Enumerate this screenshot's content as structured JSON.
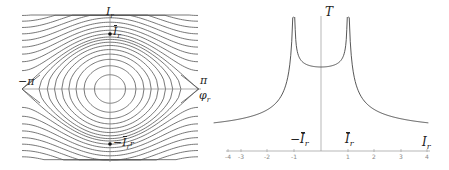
{
  "left_panel": {
    "title": "Phase portrait",
    "labels": {
      "vertical_axis": "I",
      "vertical_axis_sub": "r",
      "upper_point": "I",
      "upper_point_sub": "r",
      "lower_point_prefix": "−",
      "lower_point": "I",
      "lower_point_sub": "r",
      "lower_point_suffix": "r",
      "left_pi": "−π",
      "right_pi": "π",
      "horizontal_axis": "φ",
      "horizontal_axis_sub": "r"
    },
    "colors": {
      "curves": "#555555",
      "axes": "#888888",
      "points": "#111111"
    }
  },
  "right_panel": {
    "title": "Period vs action",
    "labels": {
      "vertical_axis": "T",
      "neg_bar_prefix": "−",
      "neg_bar": "I",
      "neg_bar_sub": "r",
      "pos_bar": "I",
      "pos_bar_sub": "r",
      "horizontal_axis": "I",
      "horizontal_axis_sub": "r"
    },
    "x_ticks": [
      "-4",
      "-3",
      "-2",
      "-1",
      "1",
      "2",
      "3",
      "4"
    ],
    "colors": {
      "curve": "#444444",
      "axes": "#999999"
    }
  },
  "chart_data": {
    "type": "line",
    "title": "",
    "xlabel": "I_r",
    "ylabel": "T",
    "xlim": [
      -4,
      4
    ],
    "x_ticks": [
      -4,
      -3,
      -2,
      -1,
      1,
      2,
      3,
      4
    ],
    "annotations": [
      "−Ī_r at x=-1",
      "Ī_r at x=1",
      "T diverges at x=±1"
    ],
    "series": [
      {
        "name": "T(I_r) outer left",
        "x": [
          -4,
          -3,
          -2,
          -1.5,
          -1.2,
          -1.05
        ],
        "y_relative": [
          0.1,
          0.15,
          0.25,
          0.4,
          0.6,
          1.0
        ]
      },
      {
        "name": "T(I_r) inner",
        "x": [
          -0.95,
          -0.8,
          -0.5,
          0,
          0.5,
          0.8,
          0.95
        ],
        "y_relative": [
          1.0,
          0.78,
          0.6,
          0.55,
          0.6,
          0.78,
          1.0
        ]
      },
      {
        "name": "T(I_r) outer right",
        "x": [
          1.05,
          1.2,
          1.5,
          2,
          3,
          4
        ],
        "y_relative": [
          1.0,
          0.6,
          0.4,
          0.25,
          0.15,
          0.1
        ]
      }
    ]
  }
}
